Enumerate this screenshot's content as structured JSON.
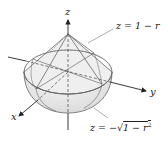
{
  "figure": {
    "type": "3D solid region diagram",
    "axes": {
      "x_label": "x",
      "y_label": "y",
      "z_label": "z"
    },
    "surfaces": {
      "upper": {
        "label": "z = 1 − r",
        "name": "cone"
      },
      "lower": {
        "label": "z = −√(1 − r²)",
        "label_prefix": "z = −",
        "label_radicand": "1 − r",
        "label_exponent": "2",
        "name": "lower hemisphere"
      }
    },
    "colors": {
      "fill": "#e6e6e6",
      "edge": "#555555",
      "axis": "#222222",
      "leader": "#777777"
    }
  }
}
